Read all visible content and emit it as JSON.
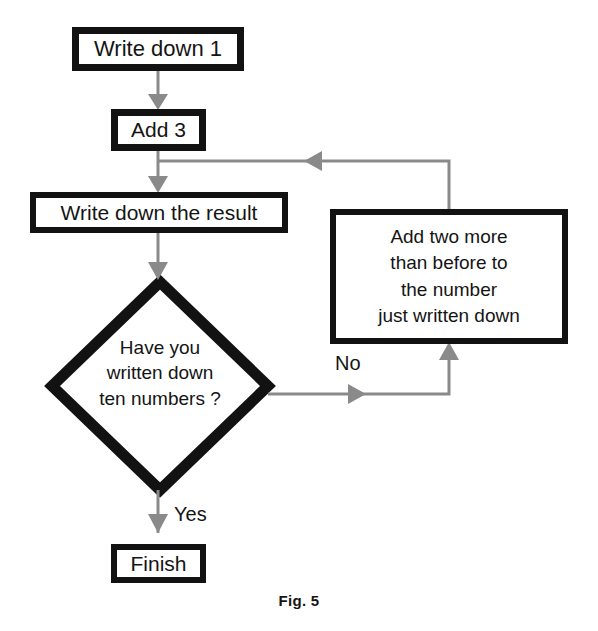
{
  "figure": {
    "caption": "Fig. 5",
    "colors": {
      "node_border": "#121212",
      "node_fill": "#ffffff",
      "connector": "#8a8a8a",
      "text": "#141414",
      "background": "#ffffff"
    }
  },
  "nodes": {
    "start": {
      "shape": "process",
      "lines": [
        "Write down 1"
      ]
    },
    "add_three": {
      "shape": "process",
      "lines": [
        "Add 3"
      ]
    },
    "write_result": {
      "shape": "process",
      "lines": [
        "Write down the result"
      ]
    },
    "decision": {
      "shape": "diamond",
      "lines": [
        "Have you",
        "written down",
        "ten numbers ?"
      ]
    },
    "add_two_more": {
      "shape": "process",
      "lines": [
        "Add two more",
        "than before to",
        "the number",
        "just written down"
      ]
    },
    "finish": {
      "shape": "terminator",
      "lines": [
        "Finish"
      ]
    }
  },
  "edge_labels": {
    "no": "No",
    "yes": "Yes"
  }
}
